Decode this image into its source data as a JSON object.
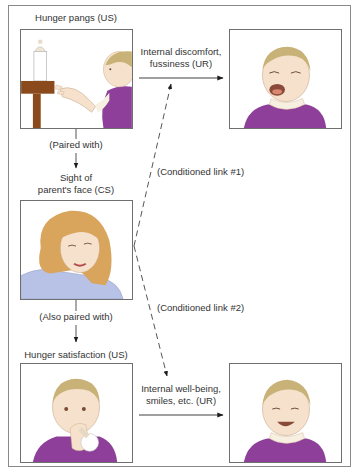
{
  "diagram": {
    "nodes": {
      "us1": {
        "label": "Hunger pangs (US)",
        "image": "baby-reaching-for-bottle"
      },
      "ur1": {
        "label_line1": "Internal discomfort,",
        "label_line2": "fussiness (UR)",
        "image": "crying-baby"
      },
      "cs": {
        "label_line1": "Sight of",
        "label_line2": "parent's face (CS)",
        "image": "parent-face"
      },
      "us2": {
        "label": "Hunger satisfaction (US)",
        "image": "baby-drinking-bottle"
      },
      "ur2": {
        "label_line1": "Internal well-being,",
        "label_line2": "smiles, etc. (UR)",
        "image": "smiling-baby"
      }
    },
    "edges": {
      "paired_with": "(Paired with)",
      "also_paired_with": "(Also paired with)",
      "conditioned_link_1": "(Conditioned link #1)",
      "conditioned_link_2": "(Conditioned link #2)"
    },
    "colors": {
      "line": "#2a2a2a",
      "frame": "#8a8a8a",
      "purple_clothing": "#8e3f9a",
      "hair_blonde": "#c9b277",
      "parent_hair": "#d9a45c",
      "parent_shirt": "#b7c2e6",
      "skin": "#f6e2cc",
      "table_wood": "#8b4a1c"
    }
  }
}
